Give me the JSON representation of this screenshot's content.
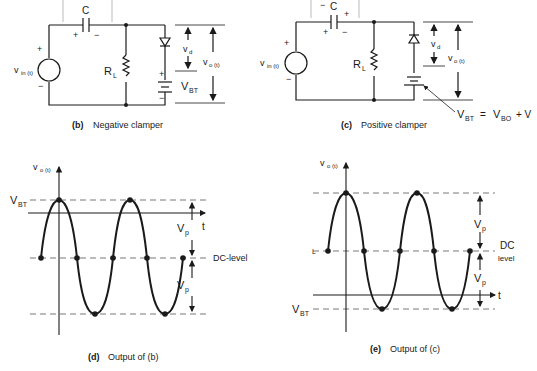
{
  "figures": {
    "b": {
      "caption_tag": "(b)",
      "caption": "Negative clamper",
      "cap_label": "C",
      "cap_plus": "+",
      "cap_minus": "−",
      "src_plus": "+",
      "src_minus": "−",
      "vin": "v",
      "vin_sub": "in (t)",
      "rl": "R",
      "rl_sub": "L",
      "vd": "v",
      "vd_sub": "d",
      "vo": "v",
      "vo_sub": "o (t)",
      "vbt": "V",
      "vbt_sub": "BT",
      "bat_plus": "+",
      "bat_minus": "−"
    },
    "c": {
      "caption_tag": "(c)",
      "caption": "Positive clamper",
      "cap_label": "C",
      "cap_top_minus": "−",
      "cap_top_plus": "+",
      "cap_plus": "+",
      "cap_minus": "−",
      "src_plus": "+",
      "src_minus": "−",
      "vin": "v",
      "vin_sub": "in (t)",
      "rl": "R",
      "rl_sub": "L",
      "vd": "v",
      "vd_sub": "d",
      "vo": "v",
      "vo_sub": "o (t)",
      "eq_vbt": "V",
      "eq_vbt_sub": "BT",
      "eq_eq": "=",
      "eq_vbo": "V",
      "eq_vbo_sub": "BO",
      "eq_plus": "+ V"
    },
    "d": {
      "caption_tag": "(d)",
      "caption": "Output of (b)",
      "yaxis": "v",
      "yaxis_sub": "o (t)",
      "vbt": "V",
      "vbt_sub": "BT",
      "t": "t",
      "vp1": "V",
      "vp1_sub": "p",
      "vp2": "V",
      "vp2_sub": "p",
      "dc": "DC-level"
    },
    "e": {
      "caption_tag": "(e)",
      "caption": "Output of (c)",
      "yaxis": "v",
      "yaxis_sub": "o (t)",
      "vbt": "V",
      "vbt_sub": "BT",
      "t": "t",
      "vp1": "V",
      "vp1_sub": "p",
      "vp2": "V",
      "vp2_sub": "p",
      "dc1": "DC",
      "dc2": "level",
      "l_mark": "L"
    }
  },
  "colors": {
    "ink": "#1a1a1a",
    "dash": "#555555"
  }
}
